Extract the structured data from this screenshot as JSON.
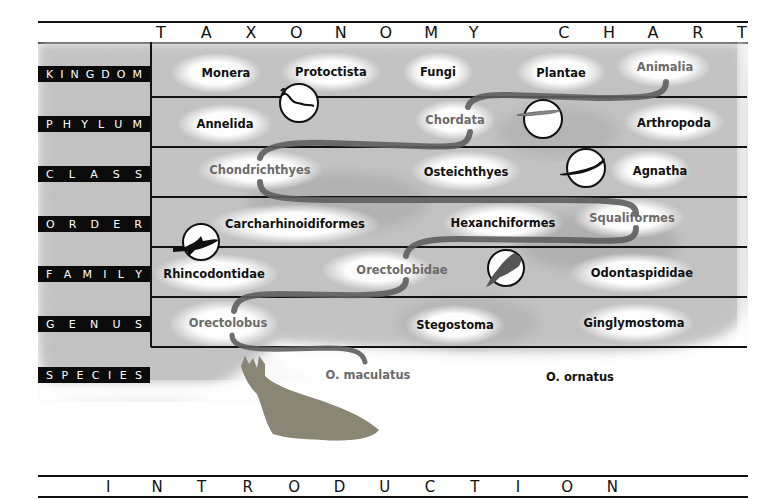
{
  "title": {
    "text": "TAXONOMY CHART",
    "letters": [
      "T",
      "A",
      "X",
      "O",
      "N",
      "O",
      "M",
      "Y",
      " ",
      "C",
      "H",
      "A",
      "R",
      "T"
    ]
  },
  "ranks": [
    {
      "label": "KINGDOM",
      "letters": [
        "K",
        "I",
        "N",
        "G",
        "D",
        "O",
        "M"
      ]
    },
    {
      "label": "PHYLUM",
      "letters": [
        "P",
        "H",
        "Y",
        "L",
        "U",
        "M"
      ]
    },
    {
      "label": "CLASS",
      "letters": [
        "C",
        "L",
        "A",
        "S",
        "S"
      ]
    },
    {
      "label": "ORDER",
      "letters": [
        "O",
        "R",
        "D",
        "E",
        "R"
      ]
    },
    {
      "label": "FAMILY",
      "letters": [
        "F",
        "A",
        "M",
        "I",
        "L",
        "Y"
      ]
    },
    {
      "label": "GENUS",
      "letters": [
        "G",
        "E",
        "N",
        "U",
        "S"
      ]
    },
    {
      "label": "SPECIES",
      "letters": [
        "S",
        "P",
        "E",
        "C",
        "I",
        "E",
        "S"
      ]
    }
  ],
  "taxa": {
    "kingdom": [
      "Monera",
      "Protoctista",
      "Fungi",
      "Plantae",
      "Animalia"
    ],
    "phylum": [
      "Annelida",
      "Chordata",
      "Arthropoda"
    ],
    "class": [
      "Chondrichthyes",
      "Osteichthyes",
      "Agnatha"
    ],
    "order": [
      "Carcharhinoidiformes",
      "Hexanchiformes",
      "Squaliformes"
    ],
    "family": [
      "Rhincodontidae",
      "Orectolobidae",
      "Odontaspididae"
    ],
    "genus": [
      "Orectolobus",
      "Stegostoma",
      "Ginglymostoma"
    ],
    "species": [
      "O. maculatus",
      "O. ornatus"
    ]
  },
  "highlighted_path": [
    "Animalia",
    "Chordata",
    "Chondrichthyes",
    "Squaliformes",
    "Orectolobidae",
    "Orectolobus",
    "O. maculatus"
  ],
  "icons": [
    {
      "name": "worm-icon",
      "row": "kingdom-phylum"
    },
    {
      "name": "lancelet-icon",
      "row": "phylum"
    },
    {
      "name": "lamprey-icon",
      "row": "class"
    },
    {
      "name": "shark-icon",
      "row": "order-family"
    },
    {
      "name": "nurse-shark-icon",
      "row": "family"
    },
    {
      "name": "wobbegong-illustration",
      "row": "species"
    }
  ],
  "footer": {
    "text": "INTRODUCTION",
    "letters": [
      "I",
      "N",
      "T",
      "R",
      "O",
      "D",
      "U",
      "C",
      "T",
      "I",
      "O",
      "N"
    ]
  },
  "colors": {
    "background": "#ffffff",
    "line": "#111111",
    "label_bg": "#0b0b0b",
    "label_text": "#ffffff",
    "path_stroke": "#5e5e5e",
    "path_text": "#6b6b6b",
    "texture": "#b9b9b9"
  }
}
